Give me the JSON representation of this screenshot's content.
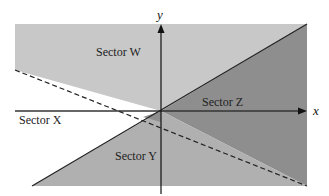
{
  "diagram": {
    "axes": {
      "x_label": "x",
      "y_label": "y"
    },
    "sectors": [
      {
        "id": "W",
        "label": "Sector W",
        "shade": "light"
      },
      {
        "id": "X",
        "label": "Sector X",
        "shade": "white"
      },
      {
        "id": "Y",
        "label": "Sector Y",
        "shade": "medium"
      },
      {
        "id": "Z",
        "label": "Sector Z",
        "shade": "dark"
      }
    ],
    "lines": [
      {
        "style": "solid",
        "description": "rising line through origin"
      },
      {
        "style": "dashed",
        "description": "falling line through origin"
      }
    ],
    "colors": {
      "light": "#c8c8c8",
      "medium": "#a9a9a9",
      "dark": "#8e8e8e",
      "background": "#ffffff"
    }
  }
}
